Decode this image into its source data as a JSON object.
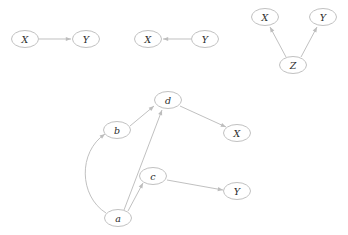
{
  "figure": {
    "background_color": "#ffffff",
    "width": 348,
    "height": 235,
    "node_stroke_color": "#b9b9b9",
    "node_fill_color": "#ffffff",
    "edge_color": "#bdbdbd",
    "label_color": "#2b2b2b"
  },
  "graphs": [
    {
      "id": "graph-chain",
      "name": "x-to-y-chain",
      "nodes": [
        {
          "id": "g1-x",
          "label": "X",
          "cx": 25,
          "cy": 39,
          "rx": 13.5,
          "ry": 8.5
        },
        {
          "id": "g1-y",
          "label": "Y",
          "cx": 86,
          "cy": 39,
          "rx": 13.5,
          "ry": 8.5
        }
      ],
      "edges": [
        {
          "id": "g1-e1",
          "from": "X",
          "to": "Y",
          "x1": 39,
          "y1": 39,
          "x2": 71,
          "y2": 39,
          "curved": false
        }
      ]
    },
    {
      "id": "graph-reverse",
      "name": "y-to-x-reverse",
      "nodes": [
        {
          "id": "g2-x",
          "label": "X",
          "cx": 148,
          "cy": 39,
          "rx": 13.5,
          "ry": 8.5
        },
        {
          "id": "g2-y",
          "label": "Y",
          "cx": 205,
          "cy": 39,
          "rx": 13.5,
          "ry": 8.5
        }
      ],
      "edges": [
        {
          "id": "g2-e1",
          "from": "Y",
          "to": "X",
          "x1": 191,
          "y1": 39,
          "x2": 163,
          "y2": 39,
          "curved": false
        }
      ]
    },
    {
      "id": "graph-fork",
      "name": "z-common-cause-fork",
      "nodes": [
        {
          "id": "g3-x",
          "label": "X",
          "cx": 265,
          "cy": 17,
          "rx": 13.5,
          "ry": 8.5
        },
        {
          "id": "g3-y",
          "label": "Y",
          "cx": 323,
          "cy": 17,
          "rx": 13.5,
          "ry": 8.5
        },
        {
          "id": "g3-z",
          "label": "Z",
          "cx": 293,
          "cy": 65,
          "rx": 13.5,
          "ry": 8.5
        }
      ],
      "edges": [
        {
          "id": "g3-e1",
          "from": "Z",
          "to": "X",
          "x1": 286,
          "y1": 57,
          "x2": 270,
          "y2": 27,
          "curved": false
        },
        {
          "id": "g3-e2",
          "from": "Z",
          "to": "Y",
          "x1": 301,
          "y1": 57,
          "x2": 317,
          "y2": 27,
          "curved": false
        }
      ]
    },
    {
      "id": "graph-main",
      "name": "main-causal-dag",
      "nodes": [
        {
          "id": "g4-d",
          "label": "d",
          "cx": 168,
          "cy": 100,
          "rx": 13.5,
          "ry": 8.5
        },
        {
          "id": "g4-b",
          "label": "b",
          "cx": 117,
          "cy": 130,
          "rx": 13.5,
          "ry": 8.5
        },
        {
          "id": "g4-x",
          "label": "X",
          "cx": 237,
          "cy": 133,
          "rx": 13.5,
          "ry": 8.5
        },
        {
          "id": "g4-c",
          "label": "c",
          "cx": 153,
          "cy": 176,
          "rx": 13.5,
          "ry": 8.5
        },
        {
          "id": "g4-y",
          "label": "Y",
          "cx": 237,
          "cy": 191,
          "rx": 13.5,
          "ry": 8.5
        },
        {
          "id": "g4-a",
          "label": "a",
          "cx": 118,
          "cy": 218,
          "rx": 13.5,
          "ry": 8.5
        }
      ],
      "edges": [
        {
          "id": "g4-e1",
          "from": "a",
          "to": "b",
          "curved": true,
          "path": "M 106 213 C 79 196 78 152 105 134"
        },
        {
          "id": "g4-e2",
          "from": "b",
          "to": "d",
          "x1": 130,
          "y1": 126,
          "x2": 154,
          "y2": 106,
          "curved": false
        },
        {
          "id": "g4-e3",
          "from": "a",
          "to": "d",
          "x1": 124,
          "y1": 210,
          "x2": 162,
          "y2": 110,
          "curved": false
        },
        {
          "id": "g4-e4",
          "from": "a",
          "to": "c",
          "x1": 128,
          "y1": 211,
          "x2": 143,
          "y2": 183,
          "curved": false
        },
        {
          "id": "g4-e5",
          "from": "d",
          "to": "X",
          "x1": 180,
          "y1": 106,
          "x2": 226,
          "y2": 127,
          "curved": false
        },
        {
          "id": "g4-e6",
          "from": "c",
          "to": "Y",
          "x1": 167,
          "y1": 180,
          "x2": 223,
          "y2": 190,
          "curved": false
        }
      ]
    }
  ]
}
